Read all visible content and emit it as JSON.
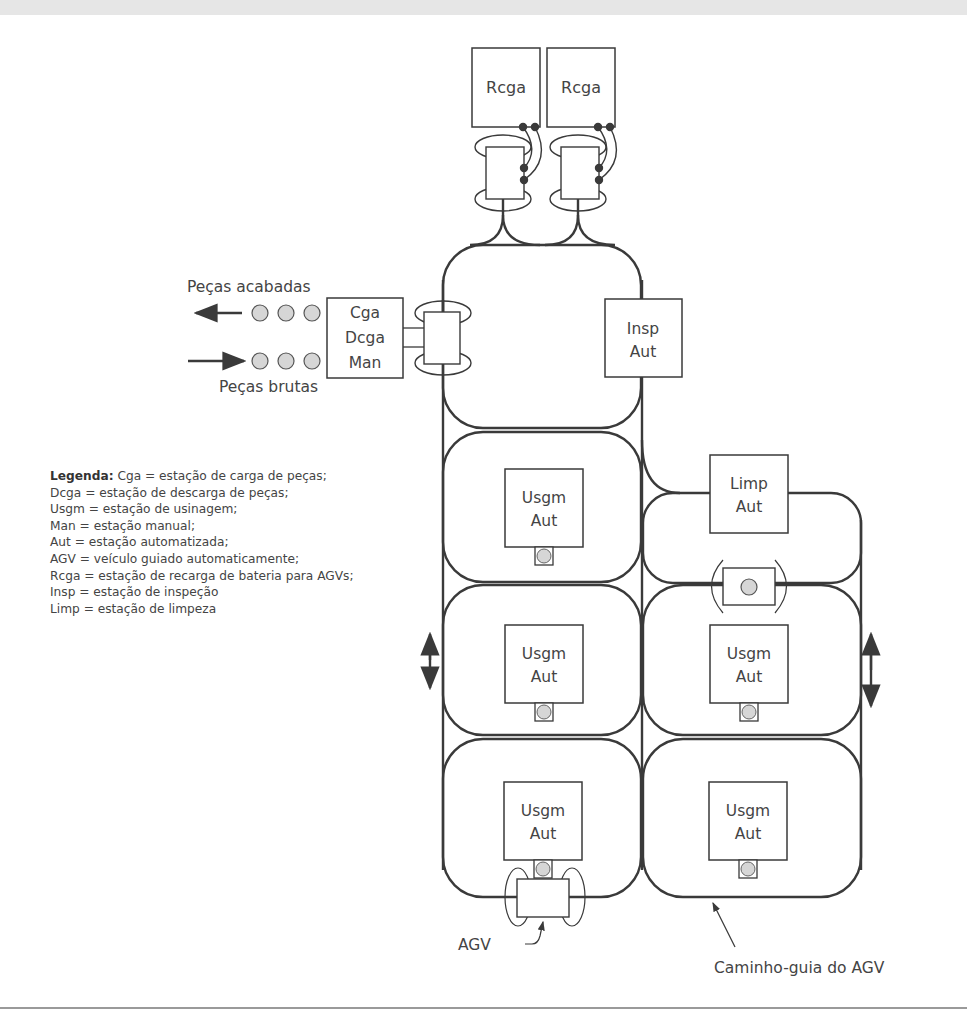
{
  "diagram": {
    "type": "layout diagram of flexible manufacturing system with AGV guide path",
    "stations": {
      "recharge_1": {
        "line1": "Rcga"
      },
      "recharge_2": {
        "line1": "Rcga"
      },
      "load_unload": {
        "line1": "Cga",
        "line2": "Dcga",
        "line3": "Man"
      },
      "inspection": {
        "line1": "Insp",
        "line2": "Aut"
      },
      "cleaning": {
        "line1": "Limp",
        "line2": "Aut"
      },
      "machining_1": {
        "line1": "Usgm",
        "line2": "Aut"
      },
      "machining_2": {
        "line1": "Usgm",
        "line2": "Aut"
      },
      "machining_3": {
        "line1": "Usgm",
        "line2": "Aut"
      },
      "machining_4": {
        "line1": "Usgm",
        "line2": "Aut"
      },
      "machining_5": {
        "line1": "Usgm",
        "line2": "Aut"
      }
    },
    "labels": {
      "finished_parts": "Peças acabadas",
      "raw_parts": "Peças brutas",
      "agv": "AGV",
      "guide_path": "Caminho-guia do AGV"
    },
    "legend": {
      "title": "Legenda:",
      "items": [
        "Cga = estação de carga de peças;",
        "Dcga = estação de descarga de peças;",
        "Usgm = estação de usinagem;",
        "Man = estação manual;",
        "Aut = estação automatizada;",
        "AGV = veículo guiado automaticamente;",
        "Rcga = estação de recarga de bateria para AGVs;",
        "Insp = estação de inspeção",
        "Limp = estação de limpeza"
      ]
    },
    "colors": {
      "line": "#3a3a3a",
      "part_fill": "#d6d6d6",
      "background": "#ffffff",
      "top_band": "#e6e6e6"
    }
  }
}
